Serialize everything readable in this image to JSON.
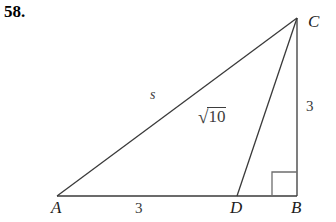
{
  "problem": {
    "number": "58."
  },
  "figure": {
    "type": "geometry-diagram",
    "background_color": "#ffffff",
    "stroke_color": "#3a3a3a",
    "text_color": "#1c1c1c",
    "vertices": [
      {
        "name": "A",
        "label": "A",
        "x": 57,
        "y": 196
      },
      {
        "name": "B",
        "label": "B",
        "x": 297,
        "y": 196
      },
      {
        "name": "C",
        "label": "C",
        "x": 297,
        "y": 18
      },
      {
        "name": "D",
        "label": "D",
        "x": 237,
        "y": 196
      }
    ],
    "segments": [
      {
        "name": "segment-AB",
        "from": "A",
        "to": "B",
        "label": "3",
        "label_kind": "length"
      },
      {
        "name": "segment-AC",
        "from": "A",
        "to": "C",
        "label": "s",
        "label_kind": "variable"
      },
      {
        "name": "segment-CB",
        "from": "C",
        "to": "B",
        "label": "3",
        "label_kind": "length"
      },
      {
        "name": "segment-CD",
        "from": "C",
        "to": "D",
        "label": "√10",
        "label_kind": "radical"
      }
    ],
    "right_angle": {
      "at_vertex": "B",
      "marker": "square",
      "size": 25
    },
    "labels": {
      "A": "A",
      "B": "B",
      "C": "C",
      "D": "D",
      "AD_length": "3",
      "CB_length": "3",
      "AC_side": "s",
      "CD_radical_sign": "√",
      "CD_radicand": "10"
    }
  }
}
